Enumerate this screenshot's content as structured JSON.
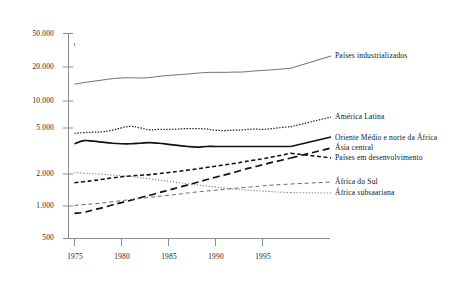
{
  "chart_data": {
    "type": "line",
    "title": "",
    "subtitle": "",
    "xlabel": "",
    "ylabel": "",
    "yscale": "log",
    "xlim": [
      1974,
      1998.5
    ],
    "ylim": [
      500,
      50000
    ],
    "grid": false,
    "legend_position": "right-inline-labels",
    "y_ticks": [
      {
        "value": 500,
        "label": "500"
      },
      {
        "value": 1000,
        "label": "1.000"
      },
      {
        "value": 2000,
        "label": "2.000"
      },
      {
        "value": 5000,
        "label": "5.000"
      },
      {
        "value": 10000,
        "label": "10.000"
      },
      {
        "value": 20000,
        "label": "20.000"
      },
      {
        "value": 50000,
        "label": "50.000"
      }
    ],
    "x_ticks": [
      {
        "value": 1975,
        "label": "1975"
      },
      {
        "value": 1980,
        "label": "1980"
      },
      {
        "value": 1985,
        "label": "1985"
      },
      {
        "value": 1990,
        "label": "1990"
      },
      {
        "value": 1995,
        "label": "1995"
      }
    ],
    "x": [
      1975,
      1976,
      1977,
      1978,
      1979,
      1980,
      1981,
      1982,
      1983,
      1984,
      1985,
      1986,
      1987,
      1988,
      1989,
      1990,
      1991,
      1992,
      1993,
      1994,
      1995,
      1996,
      1997,
      1998
    ],
    "series": [
      {
        "name": "Países industrializados",
        "label": "Países industrializados",
        "style": "solid-thin",
        "color": "#555555",
        "values": [
          16000,
          16600,
          17100,
          17600,
          18100,
          18400,
          18500,
          18400,
          18600,
          19100,
          19500,
          19800,
          20100,
          20500,
          20800,
          20900,
          20900,
          21000,
          21100,
          21500,
          21800,
          22100,
          22500,
          22900
        ]
      },
      {
        "name": "América Latina",
        "label": "América Latina",
        "style": "dotted-fine",
        "color": "#1a1a1a",
        "values": [
          5300,
          5400,
          5450,
          5500,
          5700,
          6000,
          6200,
          6000,
          5750,
          5800,
          5800,
          5850,
          5900,
          5900,
          5850,
          5700,
          5650,
          5700,
          5750,
          5850,
          5800,
          5900,
          6050,
          6150
        ]
      },
      {
        "name": "Oriente Médio e norte da África",
        "label": "Oriente Médio e norte da África",
        "style": "solid-bold",
        "color": "#111111",
        "values": [
          4200,
          4500,
          4450,
          4350,
          4250,
          4200,
          4200,
          4250,
          4300,
          4250,
          4150,
          4050,
          3950,
          3900,
          3950,
          3950,
          3950,
          3950,
          3950,
          3950,
          3950,
          3950,
          3950,
          3950
        ]
      },
      {
        "name": "Ásia central",
        "label": "Ásia central",
        "style": "dashed-long",
        "color": "#111111",
        "values": [
          880,
          900,
          950,
          1000,
          1060,
          1120,
          1180,
          1250,
          1320,
          1400,
          1480,
          1570,
          1660,
          1760,
          1870,
          1980,
          2090,
          2210,
          2350,
          2480,
          2620,
          2760,
          2900,
          3050
        ]
      },
      {
        "name": "Países em desenvolvimento",
        "label": "Países em desenvolvimento",
        "style": "dashed-medium",
        "color": "#111111",
        "values": [
          1750,
          1790,
          1840,
          1890,
          1950,
          2000,
          2040,
          2070,
          2100,
          2150,
          2200,
          2260,
          2320,
          2390,
          2460,
          2540,
          2620,
          2700,
          2800,
          2900,
          3000,
          3120,
          3250,
          3400
        ]
      },
      {
        "name": "África do Sul",
        "label": "África do Sul",
        "style": "dashed-fine",
        "color": "#4a4a4a",
        "values": [
          1050,
          1070,
          1090,
          1110,
          1140,
          1170,
          1200,
          1230,
          1260,
          1290,
          1320,
          1350,
          1390,
          1420,
          1450,
          1480,
          1510,
          1540,
          1570,
          1600,
          1630,
          1660,
          1680,
          1700
        ]
      },
      {
        "name": "África subsaariana",
        "label": "África subsaariana",
        "style": "dotted-sparse",
        "color": "#3a3a3a",
        "values": [
          2200,
          2170,
          2140,
          2110,
          2080,
          2050,
          2010,
          1960,
          1910,
          1860,
          1810,
          1760,
          1710,
          1670,
          1630,
          1590,
          1550,
          1520,
          1490,
          1470,
          1450,
          1430,
          1415,
          1400
        ]
      }
    ]
  },
  "axes": {
    "y_labels": [
      "50.000",
      "20.000",
      "10.000",
      "5.000",
      "2.000",
      "1.000",
      "500"
    ],
    "x_labels": [
      "1975",
      "1980",
      "1985",
      "1990",
      "1995"
    ]
  },
  "series_labels": {
    "industrializados": "Países industrializados",
    "america_latina": "América Latina",
    "oriente_medio": "Oriente Médio e norte da África",
    "asia_central": "Ásia central",
    "em_desenvolvimento": "Países em desenvolvimento",
    "africa_do_sul": "África do Sul",
    "africa_subsaariana": "África subsaariana"
  }
}
